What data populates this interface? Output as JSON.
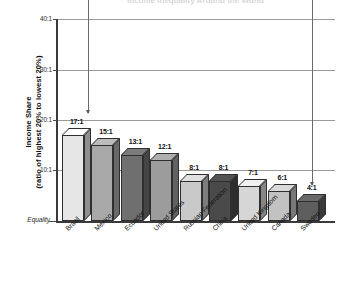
{
  "chart_data": {
    "type": "bar",
    "title": "Income Inequality Around the World",
    "xlabel": "",
    "ylabel": "Income Share (ratio of highest 20% to lowest 20%)",
    "ylabel_line1": "Income Share",
    "ylabel_line2": "(ratio of highest 20% to lowest 20%)",
    "categories": [
      "Brazil",
      "Mexico",
      "Ecuador",
      "United States",
      "Russian Federation",
      "China",
      "United Kingdom",
      "Canada",
      "Sweden"
    ],
    "values": [
      17,
      15,
      13,
      12,
      8,
      8,
      7,
      6,
      4
    ],
    "value_labels": [
      "17:1",
      "15:1",
      "13:1",
      "12:1",
      "8:1",
      "8:1",
      "7:1",
      "6:1",
      "4:1"
    ],
    "bar_colors": [
      "#e6e6e6",
      "#a8a8a8",
      "#6f6f6f",
      "#9c9c9c",
      "#c9c9c9",
      "#4a4a4a",
      "#d6d6d6",
      "#c2c2c2",
      "#5e5e5e"
    ],
    "ylim": [
      0,
      40
    ],
    "ytick_values": [
      0,
      10,
      20,
      30,
      40
    ],
    "ytick_labels": [
      "Equality",
      "10:1",
      "20:1",
      "30:1",
      "40:1"
    ],
    "grid": true,
    "legend": "none",
    "annotations": [
      {
        "name": "left-pointer",
        "label": "",
        "x_category": "Brazil",
        "y_value": 21
      },
      {
        "name": "right-pointer",
        "label": "",
        "x_category": "Sweden",
        "y_value": 7
      }
    ]
  }
}
